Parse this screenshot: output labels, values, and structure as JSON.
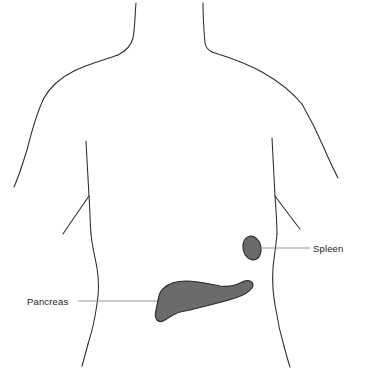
{
  "figure": {
    "background_color": "#ffffff"
  },
  "style": {
    "outline_color": "#2b2b2b",
    "organ_fill_color": "#6b6b6b",
    "organ_stroke_color": "#2b2b2b",
    "leader_line_color": "#8a8a8a",
    "label_text_color": "#1c1c1c"
  },
  "labels": [
    {
      "id": "spleen",
      "text": "Spleen",
      "text_x": 313,
      "text_y": 252,
      "leader_from_x": 262,
      "leader_from_y": 248,
      "leader_to_x": 310,
      "leader_to_y": 248,
      "anchor": "start"
    },
    {
      "id": "pancreas",
      "text": "Pancreas",
      "text_x": 27,
      "text_y": 305,
      "leader_from_x": 78,
      "leader_from_y": 301,
      "leader_to_x": 183,
      "leader_to_y": 301,
      "anchor": "start"
    }
  ],
  "organs": [
    {
      "id": "spleen",
      "name": "Spleen",
      "shape": "oval",
      "center_x": 252,
      "center_y": 248,
      "radius_x": 9,
      "radius_y": 12,
      "rotation_deg": -12,
      "fill": "#6b6b6b"
    },
    {
      "id": "pancreas",
      "name": "Pancreas",
      "shape": "path",
      "fill": "#6b6b6b",
      "path": "M 164 288 C 168 284 176 281 186 281 C 198 281 210 284 220 286 C 228 287 234 286 240 283 C 244 281 247 280 250 281 C 253 282 254 285 252 288 C 249 292 244 295 238 297 C 230 300 222 302 214 304 C 206 306 198 308 190 310 C 184 311 179 312 175 314 C 171 316 168 318 165 320 C 162 322 159 322 157 320 C 155 318 155 314 156 310 C 157 305 158 300 159 296 C 160 292 161 290 164 288 Z"
    }
  ],
  "body_paths": [
    {
      "id": "neck-left",
      "d": "M 136 3 C 135 14 135 28 133 38 C 131 46 126 51 118 55"
    },
    {
      "id": "neck-right",
      "d": "M 203 3 C 203 16 204 32 205 43 C 206 48 208 50 212 52"
    },
    {
      "id": "shoulder-left",
      "d": "M 118 55 C 104 60 88 64 74 71 C 60 78 50 87 44 98"
    },
    {
      "id": "shoulder-right",
      "d": "M 212 52 C 228 57 246 63 262 72 C 278 81 292 92 302 104"
    },
    {
      "id": "arm-left-outer",
      "d": "M 44 98 C 37 112 32 130 27 150 C 22 166 18 178 14 187"
    },
    {
      "id": "arm-right-outer",
      "d": "M 302 104 C 310 118 318 134 324 148 C 329 160 334 170 338 178"
    },
    {
      "id": "torso-left-side",
      "d": "M 86 141 C 87 160 88 180 89 196 C 90 210 90 222 91 234"
    },
    {
      "id": "rib-left",
      "d": "M 89 196 C 80 209 71 222 63 234"
    },
    {
      "id": "torso-left-waist",
      "d": "M 91 234 C 92 246 95 257 97 268 C 99 280 99 292 97 304 C 95 318 92 332 88 344"
    },
    {
      "id": "hip-left",
      "d": "M 88 344 C 86 352 84 359 82 366"
    },
    {
      "id": "torso-right-side",
      "d": "M 272 138 C 273 158 274 178 275 196 C 276 210 277 222 277 234"
    },
    {
      "id": "rib-right",
      "d": "M 275 196 C 284 208 292 219 300 229"
    },
    {
      "id": "torso-right-waist",
      "d": "M 277 234 C 276 246 274 257 273 268 C 272 282 273 296 276 310 C 278 324 281 336 284 346"
    },
    {
      "id": "hip-right",
      "d": "M 284 346 C 286 354 288 361 290 367"
    }
  ]
}
